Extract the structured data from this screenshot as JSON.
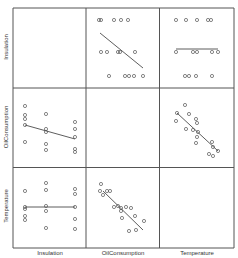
{
  "chart_data": {
    "type": "scatter",
    "subtype": "scatterplot_matrix",
    "title": "",
    "variables": [
      "Insulation",
      "OilConsumption",
      "Temperature"
    ],
    "diagonal": "blank",
    "fit_lines": true,
    "grid": false,
    "panels": [
      {
        "row": 0,
        "col": 1,
        "x_var": "OilConsumption",
        "y_var": "Insulation",
        "points": [
          [
            99,
            20
          ],
          [
            101,
            20
          ],
          [
            114,
            20
          ],
          [
            121,
            20
          ],
          [
            128,
            20
          ],
          [
            101,
            52
          ],
          [
            107,
            52
          ],
          [
            118,
            52
          ],
          [
            120,
            52
          ],
          [
            135,
            52
          ],
          [
            109,
            76
          ],
          [
            125,
            76
          ],
          [
            129,
            76
          ],
          [
            134,
            76
          ],
          [
            143,
            76
          ]
        ],
        "fit": [
          [
            100,
            33
          ],
          [
            143,
            68
          ]
        ]
      },
      {
        "row": 0,
        "col": 2,
        "x_var": "Temperature",
        "y_var": "Insulation",
        "points": [
          [
            176,
            20
          ],
          [
            186,
            20
          ],
          [
            197,
            20
          ],
          [
            208,
            20
          ],
          [
            211,
            20
          ],
          [
            176,
            52
          ],
          [
            193,
            52
          ],
          [
            197,
            52
          ],
          [
            212,
            52
          ],
          [
            218,
            52
          ],
          [
            185,
            76
          ],
          [
            189,
            76
          ],
          [
            196,
            76
          ],
          [
            212,
            76
          ]
        ],
        "fit": [
          [
            176,
            49
          ],
          [
            218,
            49
          ]
        ]
      },
      {
        "row": 1,
        "col": 0,
        "x_var": "Insulation",
        "y_var": "OilConsumption",
        "points": [
          [
            25,
            106
          ],
          [
            25,
            115
          ],
          [
            25,
            119
          ],
          [
            25,
            125
          ],
          [
            25,
            142
          ],
          [
            46,
            114
          ],
          [
            46,
            129
          ],
          [
            46,
            132
          ],
          [
            46,
            144
          ],
          [
            46,
            150
          ],
          [
            75,
            122
          ],
          [
            75,
            129
          ],
          [
            75,
            137
          ],
          [
            75,
            149
          ],
          [
            75,
            152
          ]
        ],
        "fit": [
          [
            25,
            125
          ],
          [
            75,
            139
          ]
        ]
      },
      {
        "row": 1,
        "col": 2,
        "x_var": "Temperature",
        "y_var": "OilConsumption",
        "points": [
          [
            185,
            105
          ],
          [
            177,
            113
          ],
          [
            189,
            114
          ],
          [
            176,
            121
          ],
          [
            196,
            119
          ],
          [
            197,
            123
          ],
          [
            186,
            129
          ],
          [
            193,
            130
          ],
          [
            198,
            132
          ],
          [
            197,
            137
          ],
          [
            196,
            143
          ],
          [
            212,
            142
          ],
          [
            213,
            147
          ],
          [
            209,
            154
          ],
          [
            218,
            151
          ],
          [
            213,
            156
          ]
        ],
        "fit": [
          [
            177,
            113
          ],
          [
            218,
            151
          ]
        ]
      },
      {
        "row": 2,
        "col": 0,
        "x_var": "Insulation",
        "y_var": "Temperature",
        "points": [
          [
            25,
            191
          ],
          [
            25,
            207
          ],
          [
            25,
            209
          ],
          [
            25,
            216
          ],
          [
            25,
            220
          ],
          [
            46,
            183
          ],
          [
            46,
            190
          ],
          [
            46,
            206
          ],
          [
            46,
            211
          ],
          [
            46,
            228
          ],
          [
            75,
            189
          ],
          [
            75,
            194
          ],
          [
            75,
            207
          ],
          [
            75,
            219
          ],
          [
            75,
            229
          ]
        ],
        "fit": [
          [
            25,
            207
          ],
          [
            75,
            207
          ]
        ]
      },
      {
        "row": 2,
        "col": 1,
        "x_var": "OilConsumption",
        "y_var": "Temperature",
        "points": [
          [
            101,
            184
          ],
          [
            100,
            191
          ],
          [
            107,
            191
          ],
          [
            110,
            191
          ],
          [
            103,
            195
          ],
          [
            114,
            207
          ],
          [
            118,
            206
          ],
          [
            121,
            208
          ],
          [
            121,
            211
          ],
          [
            126,
            207
          ],
          [
            131,
            208
          ],
          [
            122,
            218
          ],
          [
            135,
            216
          ],
          [
            144,
            221
          ],
          [
            129,
            231
          ],
          [
            136,
            230
          ]
        ],
        "fit": [
          [
            103,
            191
          ],
          [
            143,
            230
          ]
        ]
      }
    ],
    "colors": {
      "frame": "#555555",
      "points": "#555555",
      "fit": "#333333"
    }
  },
  "labels": {
    "y": [
      "Insulation",
      "OilConsumption",
      "Temperature"
    ],
    "x": [
      "Insulation",
      "OilConsumption",
      "Temperature"
    ]
  }
}
